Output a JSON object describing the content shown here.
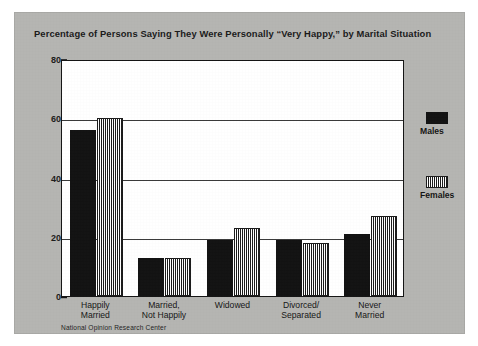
{
  "figure": {
    "title": "Percentage of Persons Saying They Were Personally “Very Happy,” by Marital Situation",
    "source_note": "National Opinion Research Center",
    "panel_color": "#b5b5b2",
    "plot_background": "#ffffff",
    "frame_color": "#141414"
  },
  "legend": {
    "position": "right",
    "entries": [
      {
        "label": "Males",
        "swatch": "solid-black-swatch",
        "color": "#121212"
      },
      {
        "label": "Females",
        "swatch": "hatched-swatch",
        "color": "#1b1b1b"
      }
    ]
  },
  "axes": {
    "y_ticks": [
      "80",
      "60",
      "40",
      "20",
      "0"
    ],
    "y_min": 0,
    "y_max": 80,
    "x_categories": [
      [
        "Happily",
        "Married"
      ],
      [
        "Married,",
        "Not Happily"
      ],
      [
        "Widowed",
        ""
      ],
      [
        "Divorced/",
        "Separated"
      ],
      [
        "Never",
        "Married"
      ]
    ]
  },
  "chart_data": {
    "type": "bar",
    "title": "Percentage of Persons Saying They Were Personally “Very Happy,” by Marital Situation",
    "xlabel": "",
    "ylabel": "",
    "ylim": [
      0,
      80
    ],
    "yticks": [
      0,
      20,
      40,
      60,
      80
    ],
    "grid": true,
    "legend_position": "right",
    "categories": [
      "Happily Married",
      "Married, Not Happily",
      "Widowed",
      "Divorced/Separated",
      "Never Married"
    ],
    "series": [
      {
        "name": "Males",
        "values": [
          56,
          13,
          19,
          19,
          21
        ]
      },
      {
        "name": "Females",
        "values": [
          60,
          13,
          23,
          18,
          27
        ]
      }
    ],
    "source": "National Opinion Research Center"
  }
}
